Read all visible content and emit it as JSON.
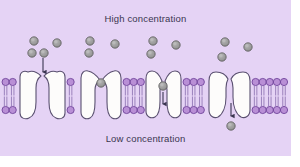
{
  "figure": {
    "title_top": "High concentration",
    "title_bottom": "Low concentration",
    "panel_background": "#e5d3f5",
    "page_background": "#ffffff",
    "width": 300,
    "height": 167
  },
  "colors": {
    "panel": "#e5d3f5",
    "lipid_head_fill": "#b98fd6",
    "lipid_head_stroke": "#6b3f97",
    "lipid_tail": "#7b5fa3",
    "protein_fill": "#fdfcfb",
    "protein_stroke": "#5a5070",
    "solute_fill": "#9b9b9b",
    "solute_stroke": "#5c5c5c",
    "arrow": "#3a3550",
    "text": "#3a3550"
  },
  "membrane": {
    "name": "phospholipid-bilayer",
    "top_head_row_y": 82,
    "bottom_head_row_y": 110,
    "head_radius": 3.6,
    "leaflet_count": 2
  },
  "channel_proteins": [
    {
      "id": "channel-1",
      "label": "open-channel-funnel",
      "state": "open-funnel",
      "center_x": 42,
      "description": "Wide funnel-shaped open channel accepting solute from above"
    },
    {
      "id": "channel-2",
      "label": "channel-with-bound-solute",
      "state": "solute-bound-at-entrance",
      "center_x": 101,
      "description": "Channel with solute molecule lodged at the upper opening"
    },
    {
      "id": "channel-3",
      "label": "channel-transporting-solute",
      "state": "solute-inside-moving-down",
      "center_x": 163,
      "description": "Narrow channel with solute inside moving downward"
    },
    {
      "id": "channel-4",
      "label": "channel-releasing-solute",
      "state": "solute-released-below",
      "center_x": 229,
      "description": "Closed channel releasing solute into low concentration side"
    }
  ],
  "solutes": {
    "name": "solute-molecules",
    "radius": 4.2,
    "above_membrane": [
      {
        "x": 34,
        "y": 41
      },
      {
        "x": 57,
        "y": 43
      },
      {
        "x": 44,
        "y": 53
      },
      {
        "x": 32,
        "y": 53
      },
      {
        "x": 90,
        "y": 41
      },
      {
        "x": 89,
        "y": 53
      },
      {
        "x": 115,
        "y": 44
      },
      {
        "x": 153,
        "y": 41
      },
      {
        "x": 151,
        "y": 54
      },
      {
        "x": 176,
        "y": 45
      },
      {
        "x": 225,
        "y": 42
      },
      {
        "x": 222,
        "y": 57
      },
      {
        "x": 248,
        "y": 47
      }
    ],
    "inside_channel": [
      {
        "x": 101,
        "y": 83,
        "channel": "channel-2"
      },
      {
        "x": 163,
        "y": 86,
        "channel": "channel-3"
      }
    ],
    "below_membrane": [
      {
        "x": 231,
        "y": 126,
        "channel": "channel-4"
      }
    ]
  },
  "arrows": [
    {
      "id": "arrow-1",
      "name": "arrow-into-channel-1",
      "x": 43,
      "y1": 58,
      "y2": 76,
      "direction": "down"
    },
    {
      "id": "arrow-2",
      "name": "arrow-through-channel-3",
      "x": 163,
      "y1": 92,
      "y2": 108,
      "direction": "down"
    },
    {
      "id": "arrow-3",
      "name": "arrow-out-of-channel-4",
      "x": 231,
      "y1": 103,
      "y2": 120,
      "direction": "down"
    }
  ],
  "diagram_meta": {
    "process": "facilitated diffusion",
    "gradient_direction": "high to low"
  }
}
